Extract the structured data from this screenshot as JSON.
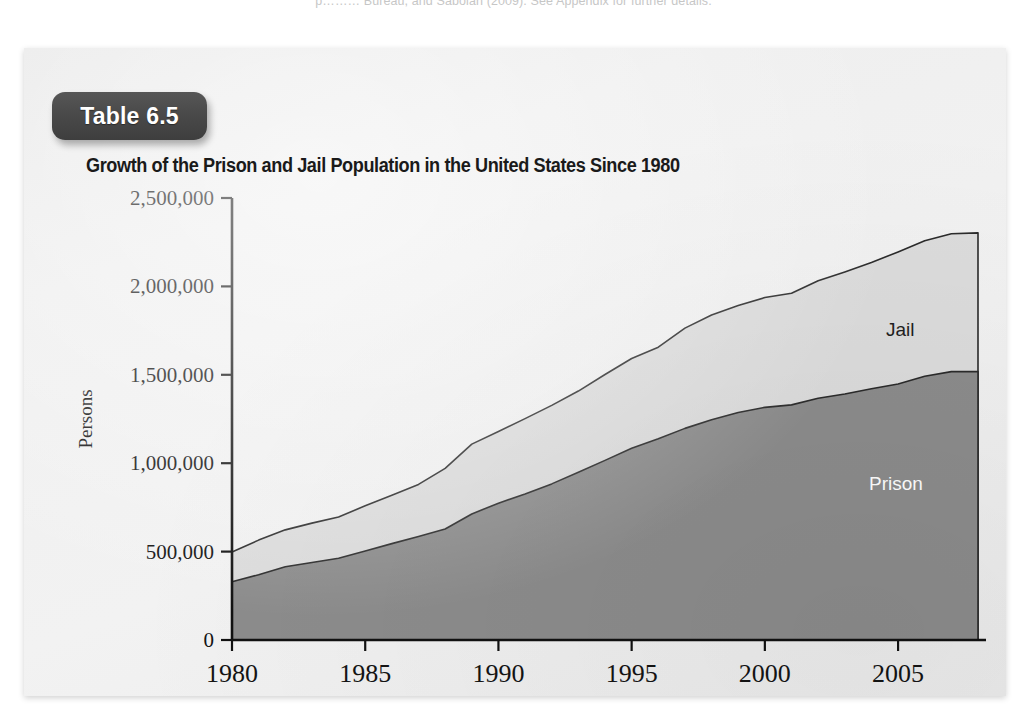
{
  "page": {
    "residual_top_text": "p……… Bureau, and Sabolan (2009). See Appendix for further details."
  },
  "badge": {
    "label": "Table 6.5"
  },
  "figure": {
    "title": "Growth of the Prison and Jail Population in the United States Since 1980"
  },
  "colors": {
    "prison_fill": "#8c8c8c",
    "jail_fill": "#dcdcdc",
    "outline": "#2b2b2b",
    "panel_bg": "#eeeeee",
    "badge_bg": "#4a4a4a",
    "axis": "#111111",
    "prison_label_text": "#ffffff",
    "jail_label_text": "#1f1f1f"
  },
  "chart_data": {
    "type": "area",
    "stacked": true,
    "title": "Growth of the Prison and Jail Population in the United States Since 1980",
    "xlabel": "",
    "ylabel": "Persons",
    "xlim": [
      1980,
      2008
    ],
    "ylim": [
      0,
      2500000
    ],
    "grid": false,
    "legend": "inline-labels",
    "x_ticks": [
      1980,
      1985,
      1990,
      1995,
      2000,
      2005
    ],
    "x_tick_labels": [
      "1980",
      "1985",
      "1990",
      "1995",
      "2000",
      "2005"
    ],
    "y_ticks": [
      0,
      500000,
      1000000,
      1500000,
      2000000,
      2500000
    ],
    "y_tick_labels": [
      "0",
      "500,000",
      "1,000,000",
      "1,500,000",
      "2,000,000",
      "2,500,000"
    ],
    "x": [
      1980,
      1981,
      1982,
      1983,
      1984,
      1985,
      1986,
      1987,
      1988,
      1989,
      1990,
      1991,
      1992,
      1993,
      1994,
      1995,
      1996,
      1997,
      1998,
      1999,
      2000,
      2001,
      2002,
      2003,
      2004,
      2005,
      2006,
      2007,
      2008
    ],
    "series": [
      {
        "name": "Prison",
        "label": "Prison",
        "color": "#8c8c8c",
        "values": [
          330000,
          369000,
          414000,
          438000,
          462000,
          503000,
          545000,
          585000,
          628000,
          713000,
          774000,
          826000,
          883000,
          949000,
          1016000,
          1085000,
          1138000,
          1197000,
          1246000,
          1287000,
          1316000,
          1330000,
          1367000,
          1391000,
          1421000,
          1448000,
          1492000,
          1518000,
          1518000
        ]
      },
      {
        "name": "Jail",
        "label": "Jail",
        "color": "#dcdcdc",
        "values": [
          168000,
          196000,
          209000,
          223000,
          234000,
          256000,
          274000,
          295000,
          343000,
          395000,
          405000,
          426000,
          444000,
          459000,
          486000,
          507000,
          518000,
          567000,
          592000,
          605000,
          621000,
          631000,
          665000,
          691000,
          714000,
          747000,
          766000,
          780000,
          785000
        ]
      }
    ],
    "totals": [
      498000,
      565000,
      623000,
      661000,
      696000,
      759000,
      819000,
      880000,
      971000,
      1108000,
      1179000,
      1252000,
      1327000,
      1408000,
      1502000,
      1592000,
      1656000,
      1764000,
      1838000,
      1892000,
      1937000,
      1961000,
      2032000,
      2082000,
      2135000,
      2195000,
      2258000,
      2298000,
      2303000
    ]
  }
}
